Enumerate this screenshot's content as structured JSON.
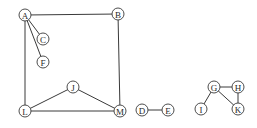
{
  "graph": {
    "nodes": [
      {
        "id": "A",
        "label": "A",
        "x": 25,
        "y": 15
      },
      {
        "id": "B",
        "label": "B",
        "x": 118,
        "y": 14
      },
      {
        "id": "C",
        "label": "C",
        "x": 43,
        "y": 39
      },
      {
        "id": "F",
        "label": "F",
        "x": 43,
        "y": 62
      },
      {
        "id": "J",
        "label": "J",
        "x": 73,
        "y": 87
      },
      {
        "id": "L",
        "label": "L",
        "x": 25,
        "y": 111
      },
      {
        "id": "M",
        "label": "M",
        "x": 120,
        "y": 111
      },
      {
        "id": "D",
        "label": "D",
        "x": 142,
        "y": 110
      },
      {
        "id": "E",
        "label": "E",
        "x": 168,
        "y": 110
      },
      {
        "id": "G",
        "label": "G",
        "x": 214,
        "y": 87
      },
      {
        "id": "H",
        "label": "H",
        "x": 238,
        "y": 87
      },
      {
        "id": "I",
        "label": "I",
        "x": 201,
        "y": 109
      },
      {
        "id": "K",
        "label": "K",
        "x": 238,
        "y": 109
      }
    ],
    "edges": [
      [
        "A",
        "B"
      ],
      [
        "A",
        "C"
      ],
      [
        "A",
        "F"
      ],
      [
        "A",
        "L"
      ],
      [
        "B",
        "M"
      ],
      [
        "L",
        "M"
      ],
      [
        "L",
        "J"
      ],
      [
        "J",
        "M"
      ],
      [
        "D",
        "E"
      ],
      [
        "G",
        "H"
      ],
      [
        "G",
        "I"
      ],
      [
        "G",
        "K"
      ],
      [
        "H",
        "K"
      ]
    ],
    "node_radius": 6
  }
}
